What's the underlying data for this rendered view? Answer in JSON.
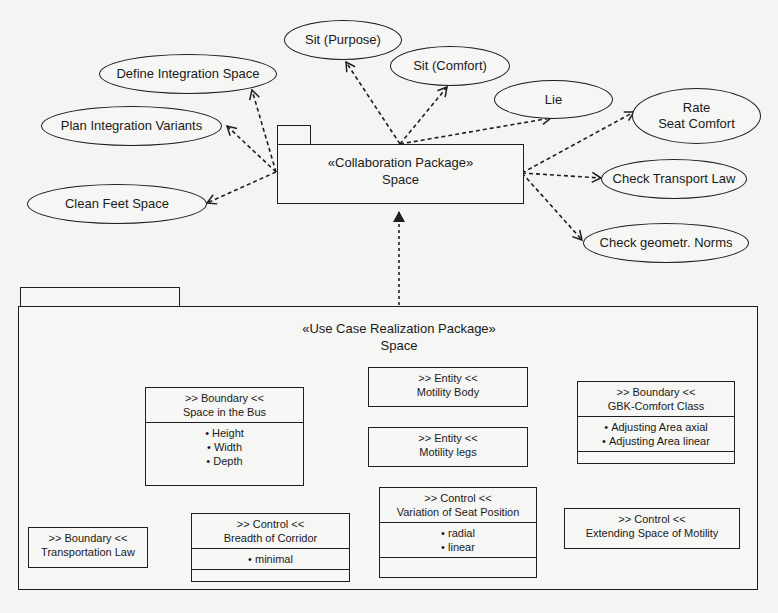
{
  "collaboration_package": {
    "stereotype": "«Collaboration Package»",
    "name": "Space"
  },
  "use_cases": [
    {
      "id": "sit-purpose",
      "lines": [
        "Sit (Purpose)"
      ]
    },
    {
      "id": "sit-comfort",
      "lines": [
        "Sit (Comfort)"
      ]
    },
    {
      "id": "define-integration-space",
      "lines": [
        "Define Integration Space"
      ]
    },
    {
      "id": "plan-integration-variants",
      "lines": [
        "Plan Integration Variants"
      ]
    },
    {
      "id": "clean-feet-space",
      "lines": [
        "Clean Feet Space"
      ]
    },
    {
      "id": "lie",
      "lines": [
        "Lie"
      ]
    },
    {
      "id": "rate-seat-comfort",
      "lines": [
        "Rate",
        "Seat Comfort"
      ]
    },
    {
      "id": "check-transport-law",
      "lines": [
        "Check Transport Law"
      ]
    },
    {
      "id": "check-geometr-norms",
      "lines": [
        "Check geometr. Norms"
      ]
    }
  ],
  "realization_package": {
    "stereotype": "«Use Case Realization Package»",
    "name": "Space"
  },
  "classes": [
    {
      "id": "space-in-the-bus",
      "stereotype": ">> Boundary <<",
      "name": "Space in the Bus",
      "attributes": [
        "Height",
        "Width",
        "Depth"
      ]
    },
    {
      "id": "motility-body",
      "stereotype": ">> Entity <<",
      "name": "Motility Body",
      "attributes": []
    },
    {
      "id": "motility-legs",
      "stereotype": ">> Entity <<",
      "name": "Motility legs",
      "attributes": []
    },
    {
      "id": "gbk-comfort-class",
      "stereotype": ">> Boundary <<",
      "name": "GBK-Comfort Class",
      "attributes": [
        "Adjusting Area axial",
        "Adjusting Area linear"
      ]
    },
    {
      "id": "transportation-law",
      "stereotype": ">> Boundary <<",
      "name": "Transportation Law",
      "attributes": []
    },
    {
      "id": "breadth-of-corridor",
      "stereotype": ">> Control <<",
      "name": "Breadth of Corridor",
      "attributes": [
        "minimal"
      ]
    },
    {
      "id": "variation-of-seat-position",
      "stereotype": ">> Control <<",
      "name": "Variation of Seat Position",
      "attributes": [
        "radial",
        "linear"
      ]
    },
    {
      "id": "extending-space-of-motility",
      "stereotype": ">> Control <<",
      "name": "Extending Space of Motility",
      "attributes": []
    }
  ],
  "relations": [
    {
      "from": "collaboration-package",
      "to": "sit-purpose",
      "type": "dependency"
    },
    {
      "from": "collaboration-package",
      "to": "sit-comfort",
      "type": "dependency"
    },
    {
      "from": "collaboration-package",
      "to": "define-integration-space",
      "type": "dependency"
    },
    {
      "from": "collaboration-package",
      "to": "plan-integration-variants",
      "type": "dependency"
    },
    {
      "from": "collaboration-package",
      "to": "clean-feet-space",
      "type": "dependency"
    },
    {
      "from": "collaboration-package",
      "to": "lie",
      "type": "dependency"
    },
    {
      "from": "collaboration-package",
      "to": "rate-seat-comfort",
      "type": "dependency"
    },
    {
      "from": "collaboration-package",
      "to": "check-transport-law",
      "type": "dependency"
    },
    {
      "from": "collaboration-package",
      "to": "check-geometr-norms",
      "type": "dependency"
    },
    {
      "from": "realization-package",
      "to": "collaboration-package",
      "type": "realization"
    },
    {
      "from": "transportation-law",
      "to": "breadth-of-corridor",
      "type": "dependency"
    }
  ],
  "colors": {
    "background": "#f4f4f2",
    "stroke": "#1e1e1e",
    "text": "#1a1a1a"
  }
}
